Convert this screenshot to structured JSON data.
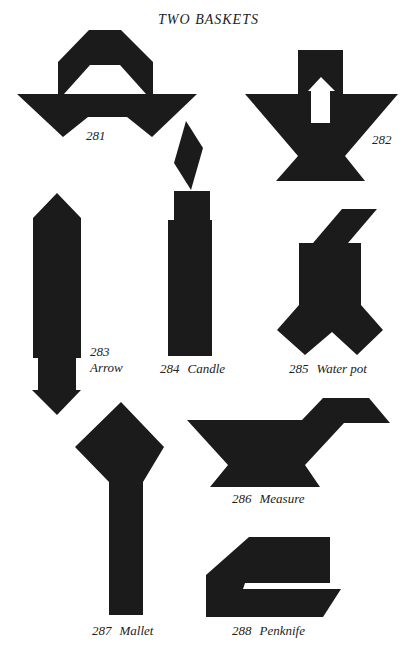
{
  "page": {
    "title": "TWO BASKETS",
    "ink_color": "#1b1b1b",
    "paper_color": "#ffffff"
  },
  "figures": [
    {
      "number": "281",
      "name": ""
    },
    {
      "number": "282",
      "name": ""
    },
    {
      "number": "283",
      "name": "Arrow"
    },
    {
      "number": "284",
      "name": "Candle"
    },
    {
      "number": "285",
      "name": "Water pot"
    },
    {
      "number": "286",
      "name": "Measure"
    },
    {
      "number": "287",
      "name": "Mallet"
    },
    {
      "number": "288",
      "name": "Penknife"
    }
  ]
}
